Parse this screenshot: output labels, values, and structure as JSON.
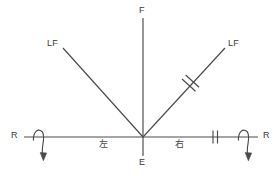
{
  "diagram": {
    "stroke_color": "#4a4a4a",
    "text_color": "#3a3a3a",
    "background_color": "#ffffff",
    "labels": {
      "top_force": "F",
      "left_lateral_force": "LF",
      "right_lateral_force": "LF",
      "left_reaction": "R",
      "right_reaction": "R",
      "origin": "E",
      "left_side": "左",
      "right_side": "右"
    },
    "geometry": {
      "origin_x": 143,
      "origin_y": 137,
      "vertical_top_y": 18,
      "vertical_bottom_y": 156,
      "horizontal_left_x": 24,
      "horizontal_right_x": 258,
      "left_diagonal_end_x": 63,
      "left_diagonal_end_y": 48,
      "right_diagonal_end_x": 225,
      "right_diagonal_end_y": 48
    },
    "tick_marks": [
      {
        "name": "right-diagonal-double-tick",
        "count": 2,
        "x": 190,
        "y": 82
      },
      {
        "name": "right-horizontal-double-tick",
        "count": 2,
        "x": 215,
        "y": 137
      }
    ],
    "moment_arrows": [
      {
        "name": "left-moment-arrow",
        "x": 40,
        "y": 137,
        "direction": "clockwise-down"
      },
      {
        "name": "right-moment-arrow",
        "x": 245,
        "y": 137,
        "direction": "clockwise-down"
      }
    ]
  }
}
